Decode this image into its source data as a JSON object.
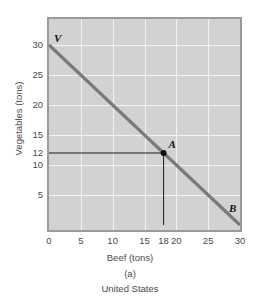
{
  "chart_data": {
    "type": "line",
    "title": "",
    "subtitle": "",
    "panel_letter": "(a)",
    "caption": "United States",
    "xlabel": "Beef (tons)",
    "ylabel": "Vegetables (tons)",
    "xlim": [
      0,
      30
    ],
    "ylim": [
      0,
      32
    ],
    "grid": true,
    "grid_spacing": 5,
    "legend": "none",
    "series": [
      {
        "name": "Production possibilities frontier",
        "x": [
          0,
          30
        ],
        "y": [
          30,
          0
        ],
        "color": "#7a7a7a"
      }
    ],
    "points": [
      {
        "label": "V",
        "x": 0,
        "y": 30,
        "marker": false
      },
      {
        "label": "A",
        "x": 18,
        "y": 12,
        "marker": true
      },
      {
        "label": "B",
        "x": 30,
        "y": 0,
        "marker": false
      }
    ],
    "guidelines": [
      {
        "from": [
          0,
          12
        ],
        "to": [
          18,
          12
        ],
        "orientation": "horizontal",
        "color": "#1a1a1a"
      },
      {
        "from": [
          18,
          0
        ],
        "to": [
          18,
          12
        ],
        "orientation": "vertical",
        "color": "#1a1a1a"
      }
    ],
    "xticks": [
      {
        "value": 0,
        "label": "0"
      },
      {
        "value": 5,
        "label": "5"
      },
      {
        "value": 10,
        "label": "10"
      },
      {
        "value": 15,
        "label": "15"
      },
      {
        "value": 18,
        "label": "18"
      },
      {
        "value": 20,
        "label": "20"
      },
      {
        "value": 25,
        "label": "25"
      },
      {
        "value": 30,
        "label": "30"
      }
    ],
    "yticks": [
      {
        "value": 30,
        "label": "30"
      },
      {
        "value": 25,
        "label": "25"
      },
      {
        "value": 20,
        "label": "20"
      },
      {
        "value": 15,
        "label": "15"
      },
      {
        "value": 12,
        "label": "12"
      },
      {
        "value": 10,
        "label": "10"
      },
      {
        "value": 5,
        "label": "5"
      }
    ],
    "colors": {
      "plot_background": "#d2d2d2",
      "plot_border": "#9a9a9a",
      "gridline": "#f2f2f2",
      "line": "#7a7a7a",
      "guideline": "#1a1a1a",
      "marker": "#111111",
      "text": "#4a4a4a",
      "page_background": "#ffffff"
    }
  }
}
